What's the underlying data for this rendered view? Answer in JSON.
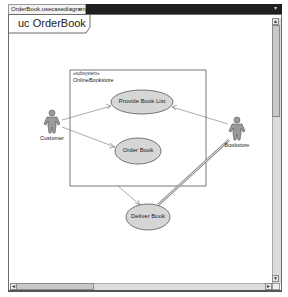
{
  "tab": {
    "label": "OrderBook.usecasediagram",
    "close_glyph": "×",
    "menu_glyph": "▾"
  },
  "diagram": {
    "title": "uc OrderBook",
    "system": {
      "stereotype": "«subsystem»",
      "name": "OnlineBookstore"
    },
    "use_cases": [
      {
        "label": "Provide Book List"
      },
      {
        "label": "Order Book"
      },
      {
        "label": "Deliver Book"
      }
    ],
    "actors": [
      {
        "label": "Customer"
      },
      {
        "label": "Bookstore"
      }
    ]
  },
  "scrollbars": {
    "up": "▲",
    "down": "▼",
    "left": "◄",
    "right": "►"
  }
}
